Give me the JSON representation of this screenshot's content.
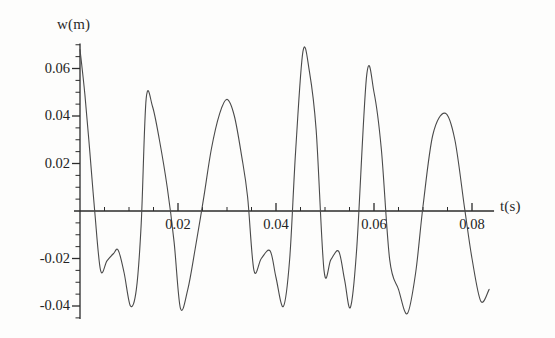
{
  "figure": {
    "background_color": "#fdfdfc",
    "line_color": "#4a4a4a",
    "axis_color": "#2b2b2b"
  },
  "axes": {
    "y_title": "w(m)",
    "x_title": "t(s)",
    "y_ticks": [
      "0.06",
      "0.04",
      "0.02",
      "-0.02",
      "-0.04"
    ],
    "x_ticks": [
      "0.02",
      "0.04",
      "0.06",
      "0.08"
    ]
  },
  "chart_data": {
    "type": "line",
    "title": "",
    "xlabel": "t(s)",
    "ylabel": "w(m)",
    "xlim": [
      -0.0005,
      0.0845
    ],
    "ylim": [
      -0.0455,
      0.0705
    ],
    "xticks": [
      0.02,
      0.04,
      0.06,
      0.08
    ],
    "yticks": [
      0.06,
      0.04,
      0.02,
      -0.02,
      -0.04
    ],
    "xtick_labels": [
      "0.02",
      "0.04",
      "0.06",
      "0.08"
    ],
    "ytick_labels": [
      "0.06",
      "0.04",
      "0.02",
      "-0.02",
      "-0.04"
    ],
    "grid": false,
    "legend": null,
    "minor_ticks": true,
    "series": [
      {
        "name": "w(t)",
        "color": "#4a4a4a",
        "linewidth": 1.1,
        "peaks": [
          {
            "t": 0.0,
            "w": 0.068
          },
          {
            "t": 0.0135,
            "w": 0.0472
          },
          {
            "t": 0.03,
            "w": 0.047
          },
          {
            "t": 0.0455,
            "w": 0.0672
          },
          {
            "t": 0.0585,
            "w": 0.057
          },
          {
            "t": 0.0745,
            "w": 0.0412
          }
        ],
        "troughs": [
          {
            "t": 0.0042,
            "w": -0.025
          },
          {
            "t": 0.0078,
            "w": -0.0165
          },
          {
            "t": 0.0103,
            "w": -0.04
          },
          {
            "t": 0.0205,
            "w": -0.041
          },
          {
            "t": 0.0355,
            "w": -0.025
          },
          {
            "t": 0.0388,
            "w": -0.0168
          },
          {
            "t": 0.0415,
            "w": -0.0402
          },
          {
            "t": 0.0498,
            "w": -0.025
          },
          {
            "t": 0.0528,
            "w": -0.017
          },
          {
            "t": 0.0552,
            "w": -0.0405
          },
          {
            "t": 0.0632,
            "w": -0.0205
          },
          {
            "t": 0.0668,
            "w": -0.0432
          },
          {
            "t": 0.0818,
            "w": -0.038
          }
        ],
        "x": [
          0.0,
          0.001,
          0.002,
          0.003,
          0.0042,
          0.0055,
          0.0068,
          0.0078,
          0.009,
          0.0103,
          0.0115,
          0.0125,
          0.0135,
          0.0148,
          0.0162,
          0.0178,
          0.0192,
          0.0205,
          0.022,
          0.0235,
          0.0252,
          0.0268,
          0.0285,
          0.03,
          0.0315,
          0.033,
          0.0342,
          0.0355,
          0.037,
          0.0388,
          0.04,
          0.0415,
          0.0428,
          0.044,
          0.0455,
          0.0468,
          0.0482,
          0.0498,
          0.0512,
          0.0528,
          0.054,
          0.0552,
          0.0565,
          0.0585,
          0.06,
          0.0615,
          0.0632,
          0.065,
          0.0668,
          0.0685,
          0.07,
          0.072,
          0.0745,
          0.0765,
          0.0785,
          0.08,
          0.0818,
          0.0835
        ],
        "y": [
          0.068,
          0.049,
          0.025,
          0.0,
          -0.025,
          -0.021,
          -0.018,
          -0.0165,
          -0.026,
          -0.04,
          -0.033,
          -0.005,
          0.0472,
          0.044,
          0.03,
          0.01,
          -0.013,
          -0.041,
          -0.033,
          -0.016,
          0.005,
          0.026,
          0.041,
          0.047,
          0.04,
          0.023,
          0.006,
          -0.025,
          -0.02,
          -0.0168,
          -0.028,
          -0.0402,
          -0.02,
          0.025,
          0.0672,
          0.059,
          0.034,
          -0.025,
          -0.0205,
          -0.017,
          -0.029,
          -0.0405,
          -0.015,
          0.057,
          0.05,
          0.026,
          -0.0205,
          -0.033,
          -0.0432,
          -0.026,
          0.002,
          0.032,
          0.0412,
          0.03,
          0.001,
          -0.02,
          -0.038,
          -0.033
        ]
      }
    ]
  }
}
